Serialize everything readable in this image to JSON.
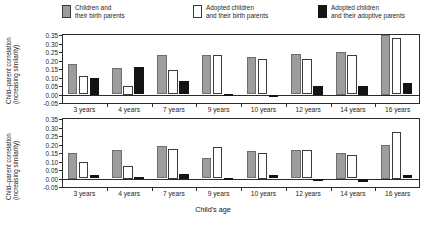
{
  "legend": {
    "items": [
      {
        "swatch": "gray",
        "line1": "Children and",
        "line2": "their birth parents"
      },
      {
        "swatch": "white",
        "line1": "Adopted children",
        "line2": "and their birth parents"
      },
      {
        "swatch": "black",
        "line1": "Adopted children",
        "line2": "and their adoptive parents"
      }
    ]
  },
  "axes": {
    "y_title_line1": "Child–parent correlation",
    "y_title_line2": "(increasing similarity)",
    "x_title": "Child's age",
    "y_ticks": [
      "0.35",
      "0.30",
      "0.25",
      "0.20",
      "0.15",
      "0.10",
      "0.05",
      "0.00",
      "-0.05"
    ]
  },
  "panels": [
    {
      "title": "VERBAL ABILITY"
    },
    {
      "title": "SPATIAL ABILITY"
    }
  ],
  "colors": {
    "gray": "#9d9d9d",
    "white": "#ffffff",
    "black": "#141414",
    "axis": "#2b2b2b"
  },
  "chart_data": [
    {
      "type": "bar",
      "title": "VERBAL ABILITY",
      "xlabel": "Child's age",
      "ylabel": "Child–parent correlation (increasing similarity)",
      "ylim": [
        -0.05,
        0.35
      ],
      "ytick_step": 0.05,
      "grid": false,
      "legend_position": "top",
      "categories": [
        "3 years",
        "4 years",
        "7 years",
        "9 years",
        "10 years",
        "12 years",
        "14 years",
        "16 years"
      ],
      "series": [
        {
          "name": "Children and their birth parents",
          "values": [
            0.18,
            0.155,
            0.23,
            0.23,
            0.22,
            0.24,
            0.25,
            0.35
          ]
        },
        {
          "name": "Adopted children and their birth parents",
          "values": [
            0.11,
            0.05,
            0.145,
            0.23,
            0.21,
            0.21,
            0.23,
            0.33
          ]
        },
        {
          "name": "Adopted children and their adoptive parents",
          "values": [
            0.1,
            0.16,
            0.08,
            0.005,
            -0.01,
            0.05,
            0.05,
            0.07
          ]
        }
      ]
    },
    {
      "type": "bar",
      "title": "SPATIAL ABILITY",
      "xlabel": "Child's age",
      "ylabel": "Child–parent correlation (increasing similarity)",
      "ylim": [
        -0.05,
        0.35
      ],
      "ytick_step": 0.05,
      "grid": false,
      "legend_position": "top",
      "categories": [
        "3 years",
        "4 years",
        "7 years",
        "9 years",
        "10 years",
        "12 years",
        "14 years",
        "16 years"
      ],
      "series": [
        {
          "name": "Children and their birth parents",
          "values": [
            0.15,
            0.17,
            0.19,
            0.12,
            0.16,
            0.17,
            0.15,
            0.2
          ]
        },
        {
          "name": "Adopted children and their birth parents",
          "values": [
            0.095,
            0.075,
            0.175,
            0.185,
            0.15,
            0.17,
            0.14,
            0.275
          ]
        },
        {
          "name": "Adopted children and their adoptive parents",
          "values": [
            0.02,
            0.01,
            0.025,
            0.005,
            0.02,
            -0.002,
            -0.02,
            0.02
          ]
        }
      ]
    }
  ]
}
